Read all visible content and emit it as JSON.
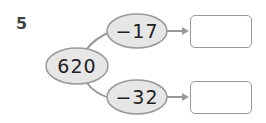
{
  "problem_number": "5",
  "start_value": "620",
  "operations": [
    {
      "label": "−17",
      "answer": ""
    },
    {
      "label": "−32",
      "answer": ""
    }
  ],
  "colors": {
    "ellipse_fill": "#e6e6e6",
    "stroke": "#999999",
    "text": "#222222"
  }
}
